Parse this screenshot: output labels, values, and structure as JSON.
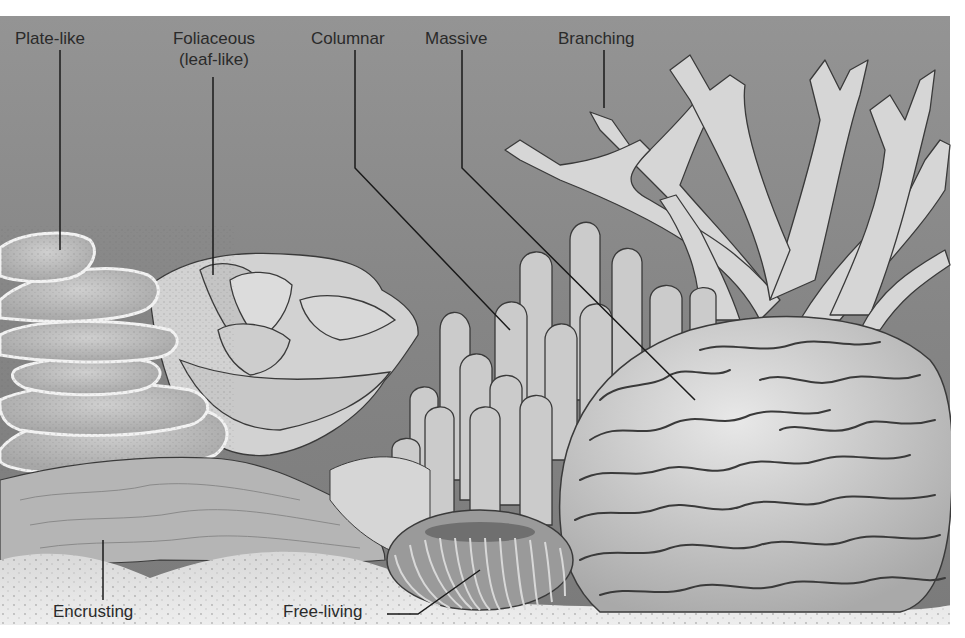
{
  "figure": {
    "colors": {
      "background_top": "#8f8f8f",
      "background_mid": "#7c7c7c",
      "sand": "#e6e6e6",
      "coral_light": "#d9d9d9",
      "coral_mid": "#bdbdbd",
      "outline": "#3a3a3a",
      "label_text": "#2a2a2a",
      "leader_line": "#1a1a1a",
      "page": "#ffffff"
    },
    "labels": [
      {
        "id": "plate-like",
        "text": "Plate-like",
        "line2": ""
      },
      {
        "id": "foliaceous",
        "text": "Foliaceous",
        "line2": "(leaf-like)"
      },
      {
        "id": "columnar",
        "text": "Columnar",
        "line2": ""
      },
      {
        "id": "massive",
        "text": "Massive",
        "line2": ""
      },
      {
        "id": "branching",
        "text": "Branching",
        "line2": ""
      },
      {
        "id": "encrusting",
        "text": "Encrusting",
        "line2": ""
      },
      {
        "id": "free-living",
        "text": "Free-living",
        "line2": ""
      }
    ]
  }
}
